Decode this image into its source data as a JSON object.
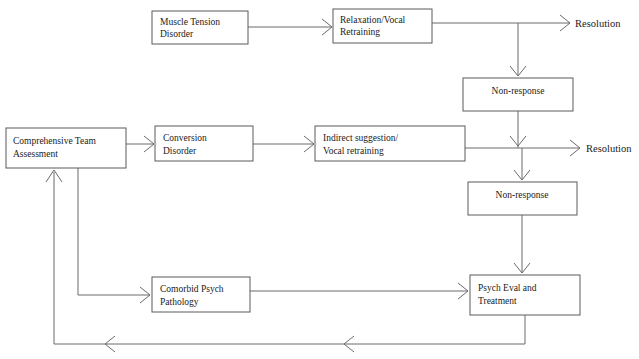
{
  "diagram": {
    "stroke_color": "#6a6a6a",
    "box_stroke_color": "#5a5a5a",
    "background_color": "#ffffff",
    "text_color": "#1a1a1a",
    "nodes": [
      {
        "id": "muscle-tension-disorder",
        "line1": "Muscle Tension",
        "line2": "Disorder",
        "x": 152,
        "y": 11,
        "w": 96,
        "h": 33
      },
      {
        "id": "relaxation-vocal-retraining",
        "line1": "Relaxation/Vocal",
        "line2": "Retraining",
        "x": 333,
        "y": 9,
        "w": 99,
        "h": 34
      },
      {
        "id": "non-response-upper",
        "line1": "Non-response",
        "line2": "",
        "x": 463,
        "y": 78,
        "w": 110,
        "h": 33
      },
      {
        "id": "comprehensive-team-assessment",
        "line1": "Comprehensive Team",
        "line2": "Assessment",
        "x": 6,
        "y": 128,
        "w": 120,
        "h": 40
      },
      {
        "id": "conversion-disorder",
        "line1": "Conversion",
        "line2": "Disorder",
        "x": 155,
        "y": 126,
        "w": 98,
        "h": 35
      },
      {
        "id": "indirect-suggestion-vocal-retraining",
        "line1": "Indirect suggestion/",
        "line2": "Vocal retraining",
        "x": 315,
        "y": 126,
        "w": 150,
        "h": 35
      },
      {
        "id": "non-response-lower",
        "line1": "Non-response",
        "line2": "",
        "x": 468,
        "y": 182,
        "w": 109,
        "h": 33
      },
      {
        "id": "comorbid-psych-pathology",
        "line1": "Comorbid Psych",
        "line2": "Pathology",
        "x": 152,
        "y": 277,
        "w": 98,
        "h": 35
      },
      {
        "id": "psych-eval-and-treatment",
        "line1": "Psych Eval and",
        "line2": "Treatment",
        "x": 470,
        "y": 275,
        "w": 110,
        "h": 40
      }
    ],
    "free_labels": [
      {
        "id": "resolution-upper",
        "text": "Resolution",
        "x": 575,
        "y": 23
      },
      {
        "id": "resolution-lower",
        "text": "Resolution",
        "x": 586,
        "y": 148
      }
    ]
  }
}
